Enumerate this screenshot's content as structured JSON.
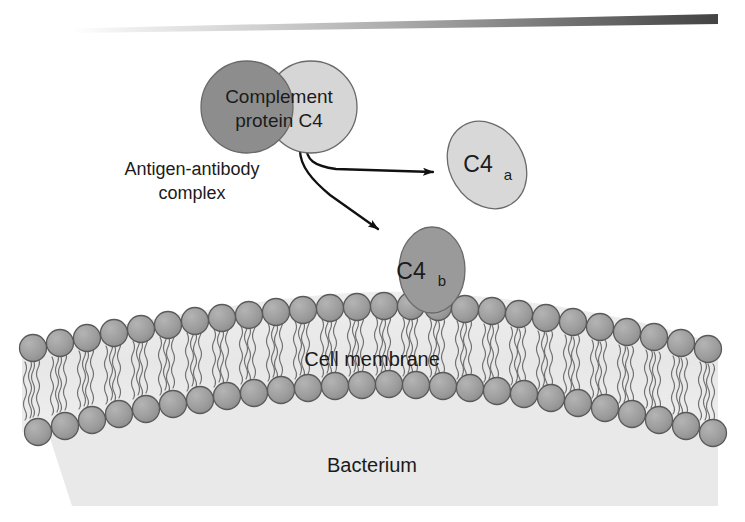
{
  "figure": {
    "width": 745,
    "height": 522
  },
  "top_rule": {
    "name": "tapered-gradient-rule",
    "color_light": "#f2f2f2",
    "color_dark": "#4a4a4a"
  },
  "labels": {
    "complement_line1": "Complement",
    "complement_line2": "protein C4",
    "antigen_line1": "Antigen-antibody",
    "antigen_line2": "complex",
    "fragment_a_base": "C4",
    "fragment_a_sub": "a",
    "fragment_b_base": "C4",
    "fragment_b_sub": "b",
    "cell_membrane": "Cell membrane",
    "bacterium": "Bacterium"
  },
  "colors": {
    "c4_left_circle": "#8d8d8d",
    "c4_right_circle": "#d6d6d6",
    "c4a_ellipse": "#d8d8d8",
    "c4b_ellipse": "#9a9a9a",
    "lipid_head": "#9d9d9d",
    "membrane_interior": "#ededed",
    "cytoplasm": "#e9e9e9",
    "arrow": "#111111",
    "text": "#1b1b1b"
  },
  "structures": {
    "c4_complex": {
      "name": "complement-protein-c4",
      "left_circle": {
        "cx": 247,
        "cy": 107,
        "r": 46
      },
      "right_circle": {
        "cx": 311,
        "cy": 107,
        "r": 46
      }
    },
    "c4a_fragment": {
      "name": "c4a-fragment",
      "cx": 487,
      "cy": 165,
      "rx": 36,
      "ry": 45,
      "rotation": -32
    },
    "c4b_fragment": {
      "name": "c4b-fragment",
      "cx": 432,
      "cy": 270,
      "rx": 33,
      "ry": 43
    },
    "membrane": {
      "name": "phospholipid-bilayer",
      "outer_leaflet_count": 27,
      "inner_leaflet_count": 26,
      "head_radius": 13
    },
    "arrows": [
      {
        "name": "arrow-to-c4a",
        "from": [
          315,
          152
        ],
        "to": [
          437,
          172
        ]
      },
      {
        "name": "arrow-to-c4b",
        "from": [
          313,
          155
        ],
        "to": [
          382,
          232
        ]
      }
    ]
  }
}
